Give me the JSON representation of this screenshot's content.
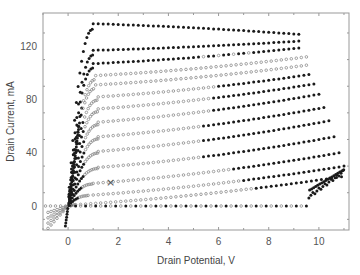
{
  "chart_data": {
    "type": "scatter",
    "title": "",
    "xlabel": "Drain Potential, V",
    "ylabel": "Drain Current, mA",
    "xlim": [
      -1,
      11.2
    ],
    "ylim": [
      -18,
      145
    ],
    "xticks": [
      0,
      2,
      4,
      6,
      8,
      10
    ],
    "yticks": [
      0,
      40,
      80,
      120
    ],
    "xtick_labels": [
      "0",
      "2",
      "4",
      "6",
      "8",
      "10"
    ],
    "ytick_labels": [
      "0",
      "40",
      "80",
      "120"
    ],
    "grid": false,
    "legend": "none",
    "marker_styles": {
      "filled": "#1a1a1a",
      "hollow": "#8a8a8a"
    },
    "series": [
      {
        "name": "curve-1",
        "isat": 137,
        "vknee": 1.0,
        "vend": 9.2,
        "iend": 129,
        "filled_from": -1
      },
      {
        "name": "curve-2",
        "isat": 117,
        "vknee": 1.0,
        "vend": 9.3,
        "iend": 124,
        "filled_from": -1
      },
      {
        "name": "curve-3",
        "isat": 107,
        "vknee": 1.0,
        "vend": 9.3,
        "iend": 119,
        "filled_from": -1,
        "hollow_range": [
          5.0,
          7.5
        ]
      },
      {
        "name": "curve-4",
        "isat": 98,
        "vknee": 1.1,
        "vend": 9.5,
        "iend": 112,
        "filled_from": 99
      },
      {
        "name": "curve-5",
        "isat": 91,
        "vknee": 1.1,
        "vend": 9.6,
        "iend": 106,
        "filled_from": 99
      },
      {
        "name": "curve-6",
        "isat": 82,
        "vknee": 1.2,
        "vend": 9.7,
        "iend": 99,
        "filled_from": 6.0
      },
      {
        "name": "curve-7",
        "isat": 73,
        "vknee": 1.2,
        "vend": 9.9,
        "iend": 92,
        "filled_from": 5.8
      },
      {
        "name": "curve-8",
        "isat": 63,
        "vknee": 1.2,
        "vend": 10.0,
        "iend": 84,
        "filled_from": 5.7
      },
      {
        "name": "curve-9",
        "isat": 52,
        "vknee": 1.2,
        "vend": 10.2,
        "iend": 74,
        "filled_from": 5.4
      },
      {
        "name": "curve-10",
        "isat": 41,
        "vknee": 1.2,
        "vend": 10.4,
        "iend": 64,
        "filled_from": 5.4
      },
      {
        "name": "curve-11",
        "isat": 29,
        "vknee": 1.2,
        "vend": 10.6,
        "iend": 52,
        "filled_from": 5.3
      },
      {
        "name": "curve-12",
        "isat": 17,
        "vknee": 1.0,
        "vend": 10.8,
        "iend": 40,
        "filled_from": 6.5
      },
      {
        "name": "curve-13",
        "isat": 8,
        "vknee": 0.8,
        "vend": 11.0,
        "iend": 30,
        "filled_from": 7.0
      },
      {
        "name": "curve-14",
        "isat": 1,
        "vknee": 0.3,
        "vend": 10.9,
        "iend": 22,
        "filled_from": 7.5
      }
    ],
    "annotations": [
      {
        "text": "×",
        "x": 1.7,
        "y": 18
      }
    ]
  }
}
